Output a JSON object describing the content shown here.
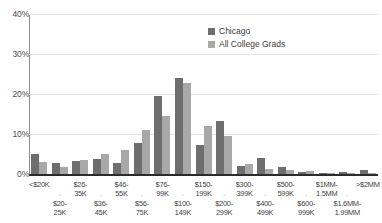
{
  "chart_data": {
    "type": "bar",
    "title": "",
    "xlabel": "",
    "ylabel": "",
    "ylim": [
      0,
      40
    ],
    "yticks": [
      "0%",
      "10%",
      "20%",
      "30%",
      "40%"
    ],
    "ytick_values": [
      0,
      10,
      20,
      30,
      40
    ],
    "grid": true,
    "legend_position": "top-right",
    "categories": [
      "<$20K",
      "$20-25K",
      "$26-35K",
      "$36-45K",
      "$46-55K",
      "$56-75K",
      "$76-99K",
      "$100-149K",
      "$150-199K",
      "$200-299K",
      "$300-399K",
      "$400-499K",
      "$500-599K",
      "$600-999K",
      "$1MM-1.5MM",
      "$1.6MM-1.99MM",
      ">$2MM"
    ],
    "category_lines": [
      [
        "<$20K",
        ""
      ],
      [
        "$20-",
        "25K"
      ],
      [
        "$26-",
        "35K"
      ],
      [
        "$36-",
        "45K"
      ],
      [
        "$46-",
        "55K"
      ],
      [
        "$56-",
        "75K"
      ],
      [
        "$76-",
        "99K"
      ],
      [
        "$100-",
        "149K"
      ],
      [
        "$150-",
        "199K"
      ],
      [
        "$200-",
        "299K"
      ],
      [
        "$300-",
        "399K"
      ],
      [
        "$400-",
        "499K"
      ],
      [
        "$500-",
        "599K"
      ],
      [
        "$600-",
        "999K"
      ],
      [
        "$1MM-",
        "1.5MM"
      ],
      [
        "$1.6MM-",
        "1.99MM"
      ],
      [
        ">$2MM",
        ""
      ]
    ],
    "series": [
      {
        "name": "Chicago",
        "color": "#6e6e6e",
        "values": [
          5.0,
          2.7,
          3.3,
          3.8,
          2.7,
          7.7,
          19.5,
          24.0,
          7.3,
          13.3,
          2.1,
          4.0,
          1.7,
          0.6,
          0.2,
          0.6,
          1.1
        ]
      },
      {
        "name": "All College Grads",
        "color": "#a8a8a8",
        "values": [
          3.0,
          1.8,
          3.4,
          4.9,
          6.0,
          11.0,
          14.5,
          22.8,
          12.0,
          9.4,
          2.6,
          1.2,
          0.9,
          0.8,
          0.3,
          0.2,
          0.3
        ]
      }
    ]
  },
  "legend": {
    "items": [
      {
        "label": "Chicago"
      },
      {
        "label": "All College Grads"
      }
    ]
  }
}
